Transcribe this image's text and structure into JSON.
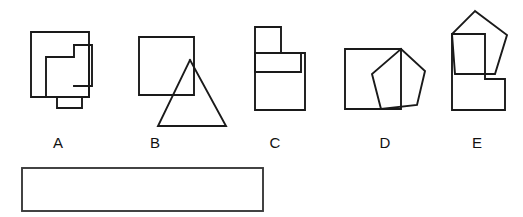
{
  "canvas": {
    "width": 523,
    "height": 217,
    "background_color": "#ffffff",
    "stroke_color": "#1a1a1a",
    "answer_box_stroke_color": "#3a3a3a"
  },
  "options": [
    {
      "id": "option-a",
      "label": "A",
      "label_x": 58,
      "label_y": 148,
      "description": "three overlapping squares",
      "shapes": [
        {
          "name": "large-square",
          "type": "polyline",
          "points": "31,32 89,32 89,97 31,97 31,32"
        },
        {
          "name": "middle-square",
          "type": "polyline",
          "points": "46,57 74,57 74,45 89,45 89,97 46,97 46,57"
        },
        {
          "name": "small-right-square",
          "type": "polyline",
          "points": "74,45 92,45 92,86 74,86"
        },
        {
          "name": "bottom-tab-square",
          "type": "polyline",
          "points": "57,97 57,108 82,108 82,97"
        }
      ]
    },
    {
      "id": "option-b",
      "label": "B",
      "label_x": 155,
      "label_y": 148,
      "description": "square overlapping a triangle",
      "shapes": [
        {
          "name": "square",
          "type": "polyline",
          "points": "139,37 194,37 194,95 139,95 139,37"
        },
        {
          "name": "triangle",
          "type": "polyline",
          "points": "190,60 226,126 158,126 190,60"
        }
      ]
    },
    {
      "id": "option-c",
      "label": "C",
      "label_x": 275,
      "label_y": 148,
      "description": "stepped rectangles forming a blocky shape",
      "shapes": [
        {
          "name": "top-small-rect",
          "type": "polyline",
          "points": "255,27 281,27 281,53 255,53 255,27"
        },
        {
          "name": "middle-horizontal-rect",
          "type": "polyline",
          "points": "255,53 301,53 301,72 255,72 255,53"
        },
        {
          "name": "large-bottom-rect",
          "type": "polyline",
          "points": "255,53 305,53 305,110 255,110 255,53"
        }
      ]
    },
    {
      "id": "option-d",
      "label": "D",
      "label_x": 385,
      "label_y": 148,
      "description": "square overlapping a pentagon",
      "shapes": [
        {
          "name": "square",
          "type": "polyline",
          "points": "345,49 401,49 401,109 345,109 345,49"
        },
        {
          "name": "pentagon",
          "type": "polyline",
          "points": "401,49 425,71 417,105 381,109 372,74 401,49"
        }
      ]
    },
    {
      "id": "option-e",
      "label": "E",
      "label_x": 477,
      "label_y": 148,
      "description": "pentagon overlapping an L-shaped polygon",
      "shapes": [
        {
          "name": "pentagon",
          "type": "polyline",
          "points": "475,11 507,35 495,74 455,74 452,34 475,11"
        },
        {
          "name": "l-shaped-polygon",
          "type": "polyline",
          "points": "452,34 485,34 485,79 505,79 505,110 452,110 452,34"
        }
      ]
    }
  ],
  "answer_box": {
    "name": "answer-box",
    "x": 22,
    "y": 168,
    "width": 241,
    "height": 43,
    "value": "",
    "placeholder": ""
  }
}
